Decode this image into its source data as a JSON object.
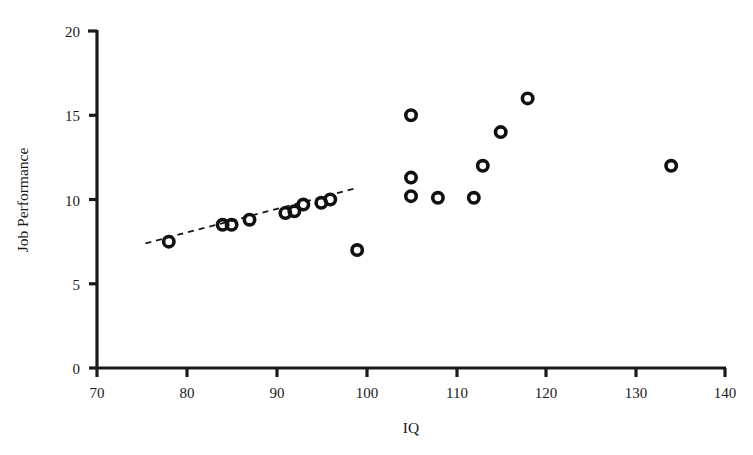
{
  "chart_data": {
    "type": "scatter",
    "title": "",
    "xlabel": "IQ",
    "ylabel": "Job Performance",
    "xlim": [
      70,
      140
    ],
    "ylim": [
      0,
      20
    ],
    "xticks": [
      70,
      80,
      90,
      100,
      110,
      120,
      130,
      140
    ],
    "yticks": [
      0,
      5,
      10,
      15,
      20
    ],
    "grid": false,
    "legend": null,
    "marker": "open-circle",
    "series": [
      {
        "name": "Observations",
        "points": [
          {
            "x": 78,
            "y": 7.5
          },
          {
            "x": 84,
            "y": 8.5
          },
          {
            "x": 85,
            "y": 8.5
          },
          {
            "x": 87,
            "y": 8.8
          },
          {
            "x": 91,
            "y": 9.2
          },
          {
            "x": 92,
            "y": 9.3
          },
          {
            "x": 93,
            "y": 9.7
          },
          {
            "x": 95,
            "y": 9.8
          },
          {
            "x": 96,
            "y": 10.0
          },
          {
            "x": 99,
            "y": 7.0
          },
          {
            "x": 105,
            "y": 15.0
          },
          {
            "x": 105,
            "y": 11.3
          },
          {
            "x": 105,
            "y": 10.2
          },
          {
            "x": 108,
            "y": 10.1
          },
          {
            "x": 112,
            "y": 10.1
          },
          {
            "x": 113,
            "y": 12.0
          },
          {
            "x": 115,
            "y": 14.0
          },
          {
            "x": 118,
            "y": 16.0
          },
          {
            "x": 134,
            "y": 12.0
          }
        ]
      }
    ],
    "trendline": {
      "name": "restricted-range-regression",
      "style": "dashed",
      "x_start": 75.4,
      "y_start": 7.4,
      "x_end": 99.1,
      "y_end": 10.7
    }
  },
  "axes": {
    "y_tick_labels": [
      "0",
      "5",
      "10",
      "15",
      "20"
    ],
    "x_tick_labels": [
      "70",
      "80",
      "90",
      "100",
      "110",
      "120",
      "130",
      "140"
    ],
    "x_axis_title": "IQ",
    "y_axis_title": "Job Performance"
  },
  "colors": {
    "axis": "#1a1a1a",
    "marker": "#111111",
    "trendline": "#1a1a1a",
    "background": "#ffffff"
  }
}
